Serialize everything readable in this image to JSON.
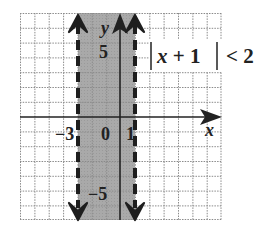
{
  "graph": {
    "x_range": [
      -7,
      7
    ],
    "y_range": [
      -7,
      7
    ],
    "grid_step": 1,
    "shaded_interval": {
      "from": -3,
      "to": 1,
      "boundary_style": "dashed",
      "fill": "#a9a9a9"
    },
    "axis_labels": {
      "x": "x",
      "y": "y"
    },
    "tick_labels": {
      "x_neg": "−3",
      "origin": "0",
      "x_pos": "1",
      "y_pos": "5",
      "y_neg": "−5"
    },
    "inequality": {
      "bar_left": "|",
      "expr": "x + 1",
      "var": "x",
      "rest": " + 1",
      "bar_right": "|",
      "relation": "< 2"
    }
  },
  "colors": {
    "grid": "#8a8a8a",
    "axis": "#222222",
    "shade": "#a9a9a9",
    "boundary": "#1e1e1e"
  }
}
